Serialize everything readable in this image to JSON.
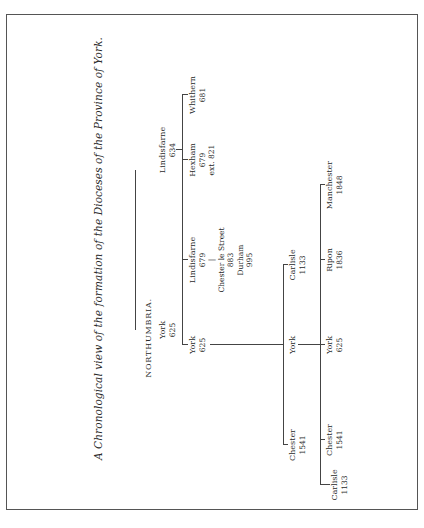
{
  "title": "A Chronological view of the formation of the Dioceses of the Province of York.",
  "heading": "NORTHUMBRIA.",
  "root": [
    {
      "name": "York",
      "year": "625"
    },
    {
      "name": "Lindisfarne",
      "year": "634"
    }
  ],
  "level1": [
    {
      "name": "York",
      "year": "625"
    },
    {
      "name": "Lindisfarne",
      "year": "679",
      "chain": [
        "Chester le Street",
        "883",
        "Durham",
        "995"
      ]
    },
    {
      "name": "Hexham",
      "year": "679",
      "note": "ext. 821"
    },
    {
      "name": "Whithern",
      "year": "681"
    }
  ],
  "level2": [
    {
      "name": "Chester",
      "year": "1541"
    },
    {
      "name": "York",
      "year": ""
    },
    {
      "name": "Carlisle",
      "year": "1133"
    }
  ],
  "level3": [
    {
      "name": "Carlisle",
      "year": "1133"
    },
    {
      "name": "Chester",
      "year": "1541"
    },
    {
      "name": "York",
      "year": "625"
    },
    {
      "name": "Ripon",
      "year": "1836"
    },
    {
      "name": "Manchester",
      "year": "1848"
    }
  ]
}
